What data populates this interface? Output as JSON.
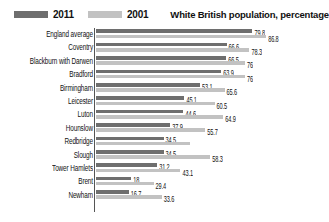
{
  "legend": {
    "items": [
      {
        "label": "2011",
        "color": "#6e6e6e",
        "swatch_name": "legend-swatch-2011"
      },
      {
        "label": "2001",
        "color": "#c2c2c2",
        "swatch_name": "legend-swatch-2001"
      }
    ]
  },
  "header": {
    "title": "White British population, percentage"
  },
  "chart_data": {
    "type": "bar",
    "orientation": "horizontal",
    "title": "White British population, percentage",
    "xlabel": "",
    "ylabel": "",
    "xlim": [
      0,
      100
    ],
    "grid": false,
    "legend_position": "top-left",
    "categories": [
      "England average",
      "Coventry",
      "Blackburn with Darwen",
      "Bradford",
      "Birmingham",
      "Leicester",
      "Luton",
      "Hounslow",
      "Redbridge",
      "Slough",
      "Tower Hamlets",
      "Brent",
      "Newham"
    ],
    "series": [
      {
        "name": "2011",
        "color": "#6e6e6e",
        "values": [
          79.8,
          66.6,
          66.5,
          63.9,
          53.1,
          45.1,
          44.6,
          37.9,
          34.5,
          34.5,
          31.2,
          18,
          16.7
        ],
        "labels": [
          "79.8",
          "66.6",
          "66.5",
          "63.9",
          "53.1",
          "45.1",
          "44.6",
          "37.9",
          "34.5",
          "34.5",
          "31.2",
          "18",
          "16.7"
        ]
      },
      {
        "name": "2001",
        "color": "#c2c2c2",
        "values": [
          86.8,
          78.3,
          76,
          76,
          65.6,
          60.5,
          64.9,
          55.7,
          48,
          58.3,
          43.1,
          29.4,
          33.6
        ],
        "labels": [
          "86.8",
          "78.3",
          "76",
          "76",
          "65.6",
          "60.5",
          "64.9",
          "55.7",
          "",
          "58.3",
          "43.1",
          "29.4",
          "33.6"
        ]
      }
    ]
  }
}
